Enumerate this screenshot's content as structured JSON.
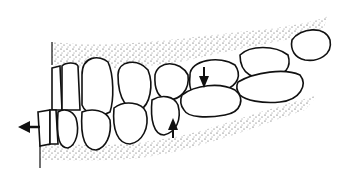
{
  "figure": {
    "arrows": [
      {
        "id": "left-arrow",
        "direction": "left"
      },
      {
        "id": "down-arrow",
        "direction": "down"
      },
      {
        "id": "up-arrow",
        "direction": "up"
      }
    ],
    "colors": {
      "line": "#111111",
      "fill": "#ffffff",
      "stipple": "#333333"
    }
  }
}
